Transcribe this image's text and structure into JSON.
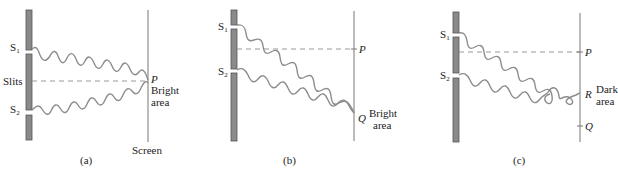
{
  "figure": {
    "panels": [
      {
        "id": "a",
        "caption": "(a)",
        "slit_top_label": "S",
        "slit_top_sub": "1",
        "slit_bottom_label": "S",
        "slit_bottom_sub": "2",
        "barrier_label": "Slits",
        "center_point_label": "P",
        "point_description_line1": "Bright",
        "point_description_line2": "area",
        "screen_label": "Screen"
      },
      {
        "id": "b",
        "caption": "(b)",
        "slit_top_label": "S",
        "slit_top_sub": "1",
        "slit_bottom_label": "S",
        "slit_bottom_sub": "2",
        "center_point_label": "P",
        "target_point_label": "Q",
        "point_description_line1": "Bright",
        "point_description_line2": "area"
      },
      {
        "id": "c",
        "caption": "(c)",
        "slit_top_label": "S",
        "slit_top_sub": "1",
        "slit_bottom_label": "S",
        "slit_bottom_sub": "2",
        "center_point_label": "P",
        "target_point_label": "R",
        "other_point_label": "Q",
        "point_description_line1": "Dark",
        "point_description_line2": "area"
      }
    ],
    "colors": {
      "barrier": "#8a8a8a",
      "barrier_edge": "#555555",
      "wave": "#8c8c8c",
      "screen": "#777777",
      "dashed": "#999999"
    }
  }
}
